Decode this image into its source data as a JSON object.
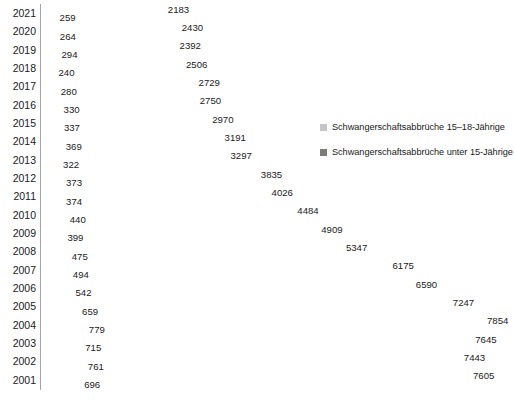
{
  "chart_data": {
    "type": "bar",
    "orientation": "horizontal",
    "title": "",
    "subtitle": "",
    "xlabel": "",
    "ylabel": "",
    "grid": false,
    "legend_position": "right",
    "xlim": [
      0,
      8400
    ],
    "categories": [
      "2021",
      "2020",
      "2019",
      "2018",
      "2017",
      "2016",
      "2015",
      "2014",
      "2013",
      "2012",
      "2011",
      "2010",
      "2009",
      "2008",
      "2007",
      "2006",
      "2005",
      "2004",
      "2003",
      "2002",
      "2001"
    ],
    "series": [
      {
        "name": "Schwangerschaftsabbrüche 15–18-Jährige",
        "color": "#c5c5c5",
        "values": [
          2183,
          2430,
          2392,
          2506,
          2729,
          2750,
          2970,
          3191,
          3297,
          3835,
          4026,
          4484,
          4909,
          5347,
          6175,
          6590,
          7247,
          7854,
          7645,
          7443,
          7605
        ]
      },
      {
        "name": "Schwangerschaftsabbrüche unter 15-Jährige",
        "color": "#7b7b7b",
        "values": [
          259,
          264,
          294,
          240,
          280,
          330,
          337,
          369,
          322,
          373,
          374,
          440,
          399,
          475,
          494,
          542,
          659,
          779,
          715,
          761,
          696
        ]
      }
    ]
  },
  "legend": {
    "items": [
      {
        "label": "Schwangerschaftsabbrüche 15–18-Jährige",
        "color": "#c5c5c5"
      },
      {
        "label": "Schwangerschaftsabbrüche unter 15-Jährige",
        "color": "#7b7b7b"
      }
    ]
  },
  "colors": {
    "series_a": "#c5c5c5",
    "series_b": "#7b7b7b",
    "axis": "#a6a6a6",
    "text": "#1a1a1a",
    "background": "#ffffff"
  }
}
